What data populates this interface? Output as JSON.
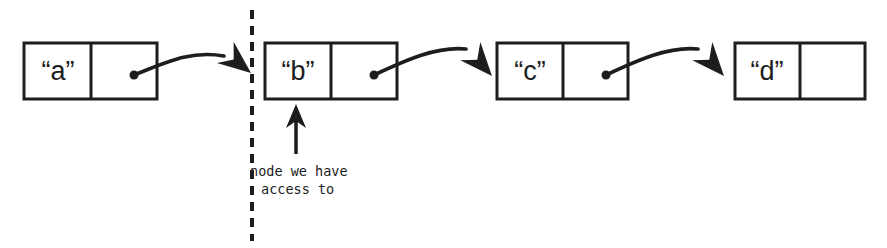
{
  "diagram": {
    "type": "linked-list",
    "background_color": "#ffffff",
    "ink_color": "#1d1d1d",
    "canvas": {
      "width": 887,
      "height": 248
    },
    "nodes": [
      {
        "id": "node-a",
        "label": "“a”",
        "value": "a",
        "x": 24,
        "y": 43,
        "width": 133,
        "height": 56,
        "divider_x": 91,
        "has_pointer": true,
        "pointer_dot": {
          "x": 134,
          "y": 75
        }
      },
      {
        "id": "node-b",
        "label": "“b”",
        "value": "b",
        "x": 265,
        "y": 43,
        "width": 132,
        "height": 56,
        "divider_x": 331,
        "has_pointer": true,
        "pointer_dot": {
          "x": 374,
          "y": 75
        }
      },
      {
        "id": "node-c",
        "label": "“c”",
        "value": "c",
        "x": 497,
        "y": 43,
        "width": 131,
        "height": 56,
        "divider_x": 563,
        "has_pointer": true,
        "pointer_dot": {
          "x": 606,
          "y": 75
        }
      },
      {
        "id": "node-d",
        "label": "“d”",
        "value": "d",
        "x": 735,
        "y": 43,
        "width": 130,
        "height": 56,
        "divider_x": 800,
        "has_pointer": false,
        "pointer_dot": null
      }
    ],
    "links": [
      {
        "id": "link-a-to-b",
        "from": "node-a",
        "to": "node-b",
        "path": "M134,75 C165,63 190,50 224,56",
        "arrow_tip": {
          "x": 251,
          "y": 73
        },
        "arrow_angle": 38
      },
      {
        "id": "link-b-to-c",
        "from": "node-b",
        "to": "node-c",
        "path": "M374,75 C406,60 437,46 466,49",
        "arrow_tip": {
          "x": 492,
          "y": 76
        },
        "arrow_angle": 48
      },
      {
        "id": "link-c-to-d",
        "from": "node-c",
        "to": "node-d",
        "path": "M606,75 C638,60 669,46 698,49",
        "arrow_tip": {
          "x": 724,
          "y": 76
        },
        "arrow_angle": 48
      }
    ],
    "boundary": {
      "id": "access-boundary",
      "orientation": "vertical",
      "x": 252,
      "y_start": 10,
      "y_end": 241,
      "style": "dashed",
      "dash_length": 9,
      "gap_length": 7,
      "stroke_width": 4
    },
    "annotation": {
      "id": "access-annotation",
      "lines": [
        "node we have",
        "access to"
      ],
      "line1": "node we have",
      "line2": "access to",
      "text_x": 250,
      "line1_y": 172,
      "line2_y": 190,
      "arrow": {
        "id": "annotation-arrow",
        "direction": "up",
        "x": 296,
        "y_tail": 154,
        "y_tip": 104,
        "stroke_width": 3.5
      }
    }
  }
}
